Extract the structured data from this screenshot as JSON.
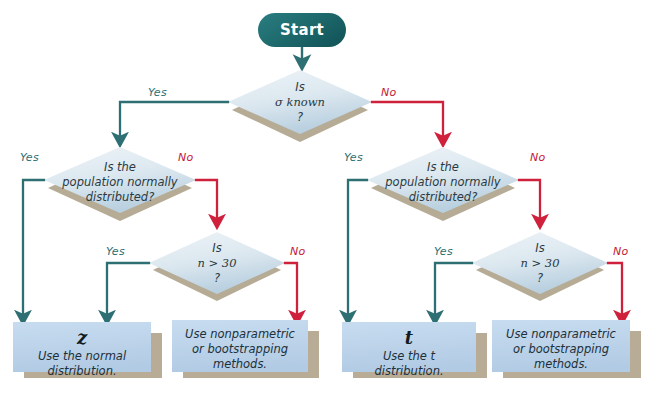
{
  "diagram": {
    "start": {
      "label": "Start"
    },
    "decisions": [
      {
        "id": "sigma-known",
        "line1": "Is",
        "line2": "σ known",
        "line3": "?"
      },
      {
        "id": "normal-left",
        "line1": "Is the",
        "line2": "population normally",
        "line3": "distributed?"
      },
      {
        "id": "n30-left",
        "line1": "Is",
        "line2": "n > 30",
        "line3": "?"
      },
      {
        "id": "normal-right",
        "line1": "Is the",
        "line2": "population normally",
        "line3": "distributed?"
      },
      {
        "id": "n30-right",
        "line1": "Is",
        "line2": "n > 30",
        "line3": "?"
      }
    ],
    "results": [
      {
        "id": "use-z",
        "symbol": "z",
        "line1": "Use the normal",
        "line2": "distribution."
      },
      {
        "id": "nonparametric-left",
        "symbol": "",
        "line1": "Use nonparametric",
        "line2": "or bootstrapping",
        "line3": "methods."
      },
      {
        "id": "use-t",
        "symbol": "t",
        "line1": "Use the t",
        "line2": "distribution."
      },
      {
        "id": "nonparametric-right",
        "symbol": "",
        "line1": "Use nonparametric",
        "line2": "or bootstrapping",
        "line3": "methods."
      }
    ],
    "edges": [
      {
        "id": "sigma-yes",
        "label": "Yes",
        "branch": "yes"
      },
      {
        "id": "sigma-no",
        "label": "No",
        "branch": "no"
      },
      {
        "id": "normal-left-yes",
        "label": "Yes",
        "branch": "yes"
      },
      {
        "id": "normal-left-no",
        "label": "No",
        "branch": "no"
      },
      {
        "id": "n30-left-yes",
        "label": "Yes",
        "branch": "yes"
      },
      {
        "id": "n30-left-no",
        "label": "No",
        "branch": "no"
      },
      {
        "id": "normal-right-yes",
        "label": "Yes",
        "branch": "yes"
      },
      {
        "id": "normal-right-no",
        "label": "No",
        "branch": "no"
      },
      {
        "id": "n30-right-yes",
        "label": "Yes",
        "branch": "yes"
      },
      {
        "id": "n30-right-no",
        "label": "No",
        "branch": "no"
      }
    ],
    "colors": {
      "start_fill": "#1d6a6c",
      "yes_line": "#2d6f73",
      "no_line": "#d0213c",
      "diamond_fill_light": "#e7eef3",
      "diamond_fill_dark": "#c3d7e4",
      "box_fill": "#bcd4ea",
      "shadow": "#b9ac96",
      "background": "#ffffff"
    }
  }
}
